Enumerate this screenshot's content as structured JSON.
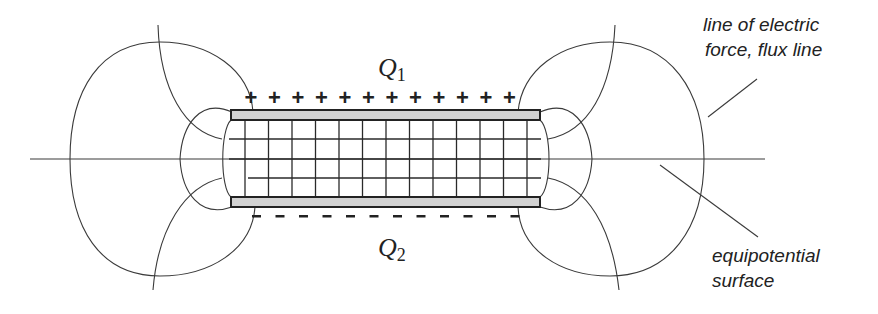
{
  "diagram": {
    "charges": {
      "top": {
        "symbol": "Q",
        "subscript": "1",
        "sign": "+",
        "count": 12
      },
      "bottom": {
        "symbol": "Q",
        "subscript": "2",
        "sign": "-",
        "count": 12
      }
    },
    "annotations": {
      "flux_line_1": "line of electric",
      "flux_line_2": "force, flux line",
      "equipotential_1": "equipotential",
      "equipotential_2": "surface"
    },
    "colors": {
      "line": "#3a3a3a",
      "plate_fill": "#d2d2d2",
      "plate_stroke": "#222222",
      "background": "#ffffff"
    }
  }
}
